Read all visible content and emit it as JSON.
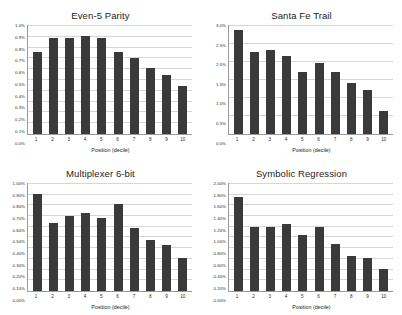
{
  "figure": {
    "background": "#ffffff",
    "bar_color": "#3a3a3a",
    "grid_color": "#d6d6d6",
    "axis_color": "#9a9a9a"
  },
  "chart_data": [
    {
      "type": "bar",
      "title": "Even-5 Parity",
      "xlabel": "Position (decile)",
      "ylabel": "",
      "categories": [
        "1",
        "2",
        "3",
        "4",
        "5",
        "6",
        "7",
        "8",
        "9",
        "10"
      ],
      "values": [
        0.75,
        0.88,
        0.88,
        0.9,
        0.88,
        0.75,
        0.7,
        0.61,
        0.54,
        0.44
      ],
      "ylim": [
        0.0,
        1.0
      ],
      "ytick_labels": [
        "1.0%",
        "0.9%",
        "0.8%",
        "0.7%",
        "0.6%",
        "0.5%",
        "0.4%",
        "0.3%",
        "0.2%",
        "0.1%",
        "0.0%"
      ],
      "ytick_values": [
        1.0,
        0.9,
        0.8,
        0.7,
        0.6,
        0.5,
        0.4,
        0.3,
        0.2,
        0.1,
        0.0
      ],
      "grid": true,
      "legend": "none"
    },
    {
      "type": "bar",
      "title": "Santa Fe Trail",
      "xlabel": "Position (decile)",
      "ylabel": "",
      "categories": [
        "1",
        "2",
        "3",
        "4",
        "5",
        "6",
        "7",
        "8",
        "9",
        "10"
      ],
      "values": [
        2.85,
        2.25,
        2.32,
        2.15,
        1.7,
        1.95,
        1.72,
        1.4,
        1.22,
        0.63
      ],
      "ylim": [
        0.0,
        3.0
      ],
      "ytick_labels": [
        "3.0%",
        "2.5%",
        "2.0%",
        "1.5%",
        "1.0%",
        "0.5%",
        "0.0%"
      ],
      "ytick_values": [
        3.0,
        2.5,
        2.0,
        1.5,
        1.0,
        0.5,
        0.0
      ],
      "grid": true,
      "legend": "none"
    },
    {
      "type": "bar",
      "title": "Multiplexer 6-bit",
      "xlabel": "Position (decile)",
      "ylabel": "",
      "categories": [
        "1",
        "2",
        "3",
        "4",
        "5",
        "6",
        "7",
        "8",
        "9",
        "10"
      ],
      "values": [
        0.9,
        0.63,
        0.69,
        0.72,
        0.68,
        0.81,
        0.58,
        0.47,
        0.43,
        0.31
      ],
      "ylim": [
        0.0,
        1.0
      ],
      "ytick_labels": [
        "1.00%",
        "0.90%",
        "0.80%",
        "0.70%",
        "0.60%",
        "0.50%",
        "0.40%",
        "0.30%",
        "0.20%",
        "0.10%",
        "0.00%"
      ],
      "ytick_values": [
        1.0,
        0.9,
        0.8,
        0.7,
        0.6,
        0.5,
        0.4,
        0.3,
        0.2,
        0.1,
        0.0
      ],
      "grid": true,
      "legend": "none"
    },
    {
      "type": "bar",
      "title": "Symbolic Regression",
      "xlabel": "Position (decile)",
      "ylabel": "",
      "categories": [
        "1",
        "2",
        "3",
        "4",
        "5",
        "6",
        "7",
        "8",
        "9",
        "10"
      ],
      "values": [
        1.75,
        1.18,
        1.18,
        1.24,
        1.03,
        1.19,
        0.87,
        0.65,
        0.62,
        0.4
      ],
      "ylim": [
        0.0,
        2.0
      ],
      "ytick_labels": [
        "2.00%",
        "1.80%",
        "1.60%",
        "1.40%",
        "1.20%",
        "1.00%",
        "0.80%",
        "0.60%",
        "0.40%",
        "0.20%",
        "0.00%"
      ],
      "ytick_values": [
        2.0,
        1.8,
        1.6,
        1.4,
        1.2,
        1.0,
        0.8,
        0.6,
        0.4,
        0.2,
        0.0
      ],
      "grid": true,
      "legend": "none"
    }
  ]
}
